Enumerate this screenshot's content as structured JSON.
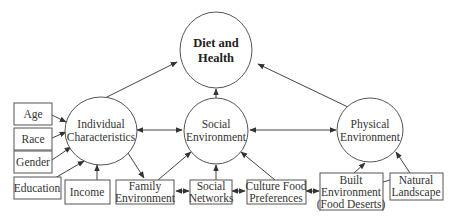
{
  "diagram": {
    "type": "conceptual-model",
    "outcome": {
      "label_lines": [
        "Diet and",
        "Health"
      ]
    },
    "constructs": [
      {
        "id": "individual",
        "label_lines": [
          "Individual",
          "Characteristics"
        ]
      },
      {
        "id": "social",
        "label_lines": [
          "Social",
          "Environment"
        ]
      },
      {
        "id": "physical",
        "label_lines": [
          "Physical",
          "Environment"
        ]
      }
    ],
    "indicators": [
      {
        "id": "age",
        "label_lines": [
          "Age"
        ]
      },
      {
        "id": "race",
        "label_lines": [
          "Race"
        ]
      },
      {
        "id": "gender",
        "label_lines": [
          "Gender"
        ]
      },
      {
        "id": "education",
        "label_lines": [
          "Education"
        ]
      },
      {
        "id": "income",
        "label_lines": [
          "Income"
        ]
      },
      {
        "id": "family",
        "label_lines": [
          "Family",
          "Environment"
        ]
      },
      {
        "id": "networks",
        "label_lines": [
          "Social",
          "Networks"
        ]
      },
      {
        "id": "culture",
        "label_lines": [
          "Culture Food",
          "Preferences"
        ]
      },
      {
        "id": "built",
        "label_lines": [
          "Built",
          "Environment",
          "(Food Deserts)"
        ]
      },
      {
        "id": "natural",
        "label_lines": [
          "Natural",
          "Landscape"
        ]
      }
    ],
    "edges": [
      {
        "from": "individual",
        "to": "outcome",
        "type": "directed"
      },
      {
        "from": "social",
        "to": "outcome",
        "type": "directed"
      },
      {
        "from": "physical",
        "to": "outcome",
        "type": "directed"
      },
      {
        "from": "individual",
        "to": "social",
        "type": "bidirectional"
      },
      {
        "from": "social",
        "to": "physical",
        "type": "bidirectional"
      },
      {
        "from": "age",
        "to": "individual",
        "type": "directed"
      },
      {
        "from": "race",
        "to": "individual",
        "type": "directed"
      },
      {
        "from": "gender",
        "to": "individual",
        "type": "directed"
      },
      {
        "from": "education",
        "to": "individual",
        "type": "directed"
      },
      {
        "from": "income",
        "to": "individual",
        "type": "directed"
      },
      {
        "from": "individual",
        "to": "family",
        "type": "directed"
      },
      {
        "from": "family",
        "to": "social",
        "type": "directed"
      },
      {
        "from": "networks",
        "to": "social",
        "type": "directed"
      },
      {
        "from": "culture",
        "to": "social",
        "type": "directed"
      },
      {
        "from": "family",
        "to": "networks",
        "type": "bidirectional"
      },
      {
        "from": "networks",
        "to": "culture",
        "type": "bidirectional"
      },
      {
        "from": "culture",
        "to": "built",
        "type": "bidirectional"
      },
      {
        "from": "built",
        "to": "physical",
        "type": "directed"
      },
      {
        "from": "natural",
        "to": "physical",
        "type": "directed"
      },
      {
        "from": "built",
        "to": "natural",
        "type": "undirected"
      }
    ]
  }
}
